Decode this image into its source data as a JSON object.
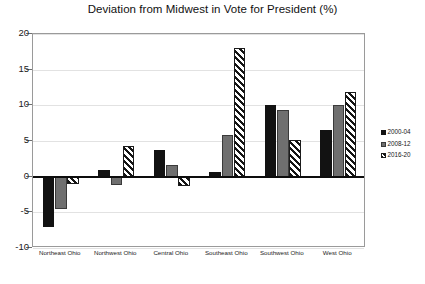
{
  "chart_data": {
    "type": "bar",
    "title": "Deviation from Midwest in Vote for President (%)",
    "xlabel": "",
    "ylabel": "",
    "ylim": [
      -10,
      20
    ],
    "yticks": [
      -10,
      -5,
      0,
      5,
      10,
      15,
      20
    ],
    "ytick_labels": [
      "-10",
      "-5",
      "0",
      "5",
      "10",
      "15",
      "20"
    ],
    "grid": true,
    "legend_position": "right",
    "categories": [
      "Northeast Ohio",
      "Northwest Ohio",
      "Central Ohio",
      "Southeast Ohio",
      "Southwest Ohio",
      "West Ohio"
    ],
    "series": [
      {
        "name": "2000-04",
        "color": "#121212",
        "pattern": "solid-black",
        "values": [
          -7.0,
          1.0,
          3.8,
          0.7,
          10.0,
          6.5
        ]
      },
      {
        "name": "2008-12",
        "color": "#6f6f6f",
        "pattern": "solid-gray",
        "values": [
          -4.6,
          -1.2,
          1.7,
          5.8,
          9.4,
          10.0
        ]
      },
      {
        "name": "2016-20",
        "color": "#141414",
        "pattern": "diagonal-hatch",
        "values": [
          -1.0,
          4.3,
          -1.3,
          18.0,
          5.2,
          11.8
        ]
      }
    ]
  }
}
